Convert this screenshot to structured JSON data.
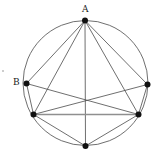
{
  "figure": {
    "type": "geometry-diagram",
    "canvas": {
      "width": 160,
      "height": 160
    },
    "background_color": "#ffffff",
    "stroke_color": "#4a4a4a",
    "point_color": "#111111",
    "label_color": "#1a1a1a",
    "highlight_color": "#8f8f8f",
    "circle": {
      "name": "main-circle",
      "cx": 85.5,
      "cy": 83,
      "r": 62.5,
      "stroke_width": 0.8
    },
    "points": [
      {
        "id": "A",
        "label": "A",
        "x": 85,
        "y": 20.5,
        "r": 3.0,
        "label_x": 82,
        "label_y": 5
      },
      {
        "id": "B",
        "label": "B",
        "x": 26.5,
        "y": 83.5,
        "r": 3.0,
        "label_x": 13,
        "label_y": 78
      },
      {
        "id": "C",
        "label": "",
        "x": 147.5,
        "y": 84.5,
        "r": 3.0,
        "label_x": 0,
        "label_y": 0
      },
      {
        "id": "D",
        "label": "",
        "x": 33.5,
        "y": 114.5,
        "r": 3.0,
        "label_x": 0,
        "label_y": 0
      },
      {
        "id": "E",
        "label": "",
        "x": 138.5,
        "y": 114.5,
        "r": 3.0,
        "label_x": 0,
        "label_y": 0
      },
      {
        "id": "F",
        "label": "",
        "x": 85.5,
        "y": 146.0,
        "r": 3.0,
        "label_x": 0,
        "label_y": 0
      }
    ],
    "chords": [
      {
        "from": "A",
        "to": "B",
        "weight": "normal"
      },
      {
        "from": "A",
        "to": "C",
        "weight": "normal"
      },
      {
        "from": "A",
        "to": "D",
        "weight": "normal"
      },
      {
        "from": "A",
        "to": "E",
        "weight": "normal"
      },
      {
        "from": "A",
        "to": "F",
        "weight": "normal"
      },
      {
        "from": "B",
        "to": "D",
        "weight": "normal"
      },
      {
        "from": "B",
        "to": "E",
        "weight": "normal"
      },
      {
        "from": "C",
        "to": "D",
        "weight": "normal"
      },
      {
        "from": "C",
        "to": "E",
        "weight": "normal"
      },
      {
        "from": "D",
        "to": "E",
        "weight": "highlight"
      },
      {
        "from": "D",
        "to": "F",
        "weight": "normal"
      },
      {
        "from": "E",
        "to": "F",
        "weight": "normal"
      }
    ],
    "stray_mark": {
      "name": "stray-mark",
      "x": 2,
      "y": 70,
      "width": 2,
      "height": 2
    }
  }
}
